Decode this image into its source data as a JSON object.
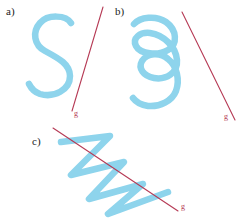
{
  "figure": {
    "background_color": "#ffffff",
    "curve_color": "#8ed4ec",
    "curve_width": 6.5,
    "line_color": "#b63a55",
    "line_width": 1.1,
    "label_color": "#1c1c1c",
    "panels": [
      {
        "id": "a",
        "label": "a)",
        "curve_name": "s-curve",
        "line_label": "g"
      },
      {
        "id": "b",
        "label": "b)",
        "curve_name": "spiral-coil-curve",
        "line_label": "g"
      },
      {
        "id": "c",
        "label": "c)",
        "curve_name": "zigzag-sawtooth-curve",
        "line_label": "g"
      }
    ]
  },
  "chart_data": {
    "type": "line",
    "title": "",
    "xlabel": "",
    "ylabel": "",
    "series": [
      {
        "name": "panel-a-s-curve",
        "panel": "a",
        "color": "#8ed4ec",
        "path": "M 71 23 C 66 15, 48 14, 40 23 C 32 32, 34 45, 45 51 C 58 58, 70 64, 70 76 C 70 90, 54 98, 40 94 C 34 92, 31 88, 29 84",
        "intersections_with_g": 1
      },
      {
        "name": "panel-a-line-g",
        "panel": "a",
        "color": "#b63a55",
        "label": "g",
        "x1": 103,
        "y1": 7,
        "x2": 72,
        "y2": 111
      },
      {
        "name": "panel-b-spiral-coil",
        "panel": "b",
        "color": "#8ed4ec",
        "path": "M 134 24 C 140 17, 156 15, 166 22 C 177 30, 178 44, 168 50 C 158 56, 140 54, 136 46 C 132 38, 140 32, 150 33 C 164 35, 176 47, 177 60 C 178 73, 166 80, 154 78 C 143 76, 138 68, 142 61 C 147 53, 160 52, 168 59 C 177 66, 180 80, 176 91 C 172 101, 160 107, 148 106 C 141 105, 136 102, 133 98",
        "intersections_with_g": 0
      },
      {
        "name": "panel-b-line-g",
        "panel": "b",
        "color": "#b63a55",
        "label": "g",
        "x1": 182,
        "y1": 12,
        "x2": 235,
        "y2": 120
      },
      {
        "name": "panel-c-zigzag",
        "panel": "c",
        "color": "#8ed4ec",
        "path": "M 61 142 L 110 136 L 71 175 L 124 162 L 89 199 L 143 184 L 108 214 L 168 192",
        "intersections_with_g": 4
      },
      {
        "name": "panel-c-line-g",
        "panel": "c",
        "color": "#b63a55",
        "label": "g",
        "x1": 53,
        "y1": 128,
        "x2": 178,
        "y2": 211
      }
    ]
  }
}
